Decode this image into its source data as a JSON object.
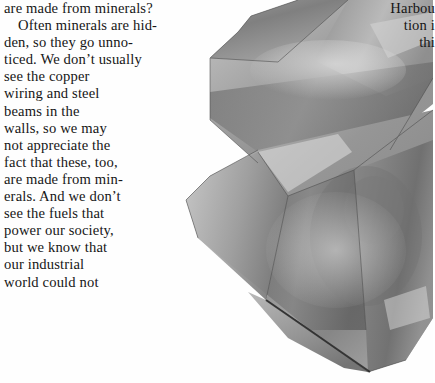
{
  "page": {
    "background_color": "#fefefe",
    "text_color": "#161616"
  },
  "body_column": {
    "name": "minerals-body-text",
    "lines": [
      {
        "text": "are made from minerals?",
        "indent": false
      },
      {
        "text": "Often minerals are hid-",
        "indent": true
      },
      {
        "text": "den, so they go unno-",
        "indent": false
      },
      {
        "text": "ticed. We don’t usually",
        "indent": false
      },
      {
        "text": "see the copper",
        "indent": false
      },
      {
        "text": "wiring and steel",
        "indent": false
      },
      {
        "text": "beams in the",
        "indent": false
      },
      {
        "text": "walls, so we may",
        "indent": false
      },
      {
        "text": "not appreciate the",
        "indent": false
      },
      {
        "text": "fact that these, too,",
        "indent": false
      },
      {
        "text": "are made from min-",
        "indent": false
      },
      {
        "text": "erals. And we don’t",
        "indent": false
      },
      {
        "text": "see the fuels that",
        "indent": false
      },
      {
        "text": "power our society,",
        "indent": false
      },
      {
        "text": "but we know that",
        "indent": false
      },
      {
        "text": "our industrial",
        "indent": false
      },
      {
        "text": "world could not",
        "indent": false
      }
    ]
  },
  "right_column": {
    "name": "clipped-right-text",
    "lines": [
      {
        "text": "Harbou"
      },
      {
        "text": "tion i"
      },
      {
        "text": "thi"
      }
    ]
  },
  "photo": {
    "name": "quartz-crystal-photograph",
    "subject": "quartz crystal specimen",
    "rendering": "grayscale",
    "tones": {
      "darkest": "#4e4e4e",
      "dark": "#6b6b6b",
      "mid": "#8c8c8c",
      "light": "#b4b4b4",
      "highlight": "#dcdcdc",
      "outline": "#2a2a2a"
    }
  }
}
